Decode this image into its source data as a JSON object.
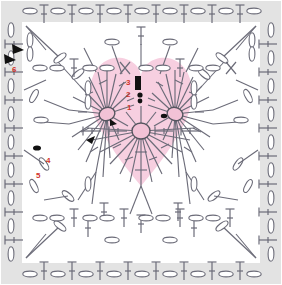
{
  "diagram": {
    "shape": "square",
    "width": 282,
    "height": 285,
    "colors": {
      "background": "#ffffff",
      "heart_fill": "#f7cfe0",
      "border_band": "#e3e3e3",
      "stitch_line": "#6b6b78",
      "label_red": "#d2342b",
      "marker_black": "#111111"
    },
    "motif": {
      "name": "heart",
      "fill": "#f7cfe0",
      "centers": [
        {
          "name": "left-lobe-ring",
          "cx": 107,
          "cy": 114,
          "spokes": 22
        },
        {
          "name": "right-lobe-ring",
          "cx": 175,
          "cy": 114,
          "spokes": 22
        },
        {
          "name": "bottom-center-ring",
          "cx": 141,
          "cy": 131,
          "spokes": 24
        }
      ]
    },
    "rounds": [
      {
        "number": "1",
        "label": "1",
        "x": 127,
        "y": 106,
        "note": "magic ring"
      },
      {
        "number": "2",
        "label": "2",
        "x": 126,
        "y": 93,
        "note": "ring increase"
      },
      {
        "number": "3",
        "label": "3",
        "x": 126,
        "y": 81,
        "note": "lobe shaping"
      },
      {
        "number": "4",
        "label": "4",
        "x": 46,
        "y": 158,
        "note": "square corner fill"
      },
      {
        "number": "5",
        "label": "5",
        "x": 36,
        "y": 173,
        "note": "V-stitch round"
      },
      {
        "number": "6",
        "label": "6",
        "x": 12,
        "y": 67,
        "note": "outer border round"
      }
    ],
    "markers": [
      {
        "name": "start-arrow-round-6",
        "x": 9,
        "y": 58,
        "rotation": 200
      },
      {
        "name": "start-arrow-round-5",
        "x": 17,
        "y": 49,
        "rotation": 200
      },
      {
        "name": "start-arrow-round-4",
        "x": 37,
        "y": 148,
        "rotation": 90
      },
      {
        "name": "start-arrow-round-3",
        "x": 138,
        "y": 80,
        "rotation": 0
      },
      {
        "name": "start-arrow-round-2",
        "x": 139,
        "y": 92,
        "rotation": 0
      },
      {
        "name": "start-arrow-left-lobe",
        "x": 113,
        "y": 122,
        "rotation": 0
      },
      {
        "name": "start-arrow-right-lobe",
        "x": 163,
        "y": 116,
        "rotation": 0
      }
    ],
    "symbols": [
      {
        "name": "chain-stitch",
        "glyph": "oval",
        "count_outer": 56
      },
      {
        "name": "double-crochet",
        "glyph": "vertical-bar-with-tick",
        "count_outer": 48
      },
      {
        "name": "slip-stitch",
        "glyph": "dot"
      },
      {
        "name": "v-stitch-cluster",
        "glyph": "v-pair"
      }
    ]
  }
}
